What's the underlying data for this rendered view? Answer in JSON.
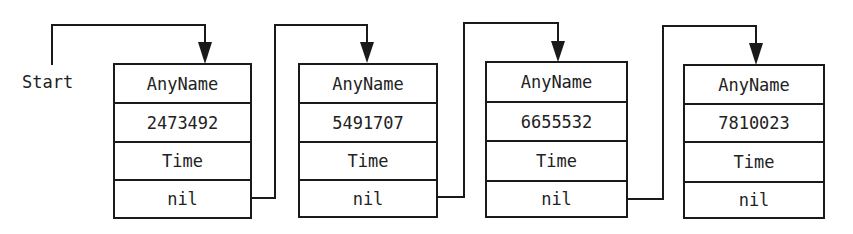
{
  "diagram": {
    "type": "linked-list",
    "start_label": "Start",
    "nodes": [
      {
        "name": "AnyName",
        "value": "2473492",
        "time": "Time",
        "next": "nil"
      },
      {
        "name": "AnyName",
        "value": "5491707",
        "time": "Time",
        "next": "nil"
      },
      {
        "name": "AnyName",
        "value": "6655532",
        "time": "Time",
        "next": "nil"
      },
      {
        "name": "AnyName",
        "value": "7810023",
        "time": "Time",
        "next": "nil"
      }
    ],
    "edges": [
      {
        "from": "Start",
        "to": "node-1"
      },
      {
        "from": "node-1.next",
        "to": "node-2"
      },
      {
        "from": "node-2.next",
        "to": "node-3"
      },
      {
        "from": "node-3.next",
        "to": "node-4"
      }
    ],
    "colors": {
      "line": "#1a1a1a",
      "text": "#222222",
      "background": "#ffffff"
    }
  }
}
